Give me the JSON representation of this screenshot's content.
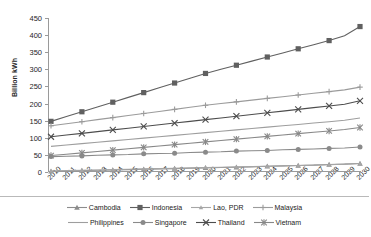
{
  "chart_data": {
    "type": "line",
    "title": "",
    "xlabel": "",
    "ylabel": "Billion kWh",
    "ylim": [
      0,
      450
    ],
    "ytick_step": 50,
    "yticks": [
      0,
      50,
      100,
      150,
      200,
      250,
      300,
      350,
      400,
      450
    ],
    "grid": false,
    "legend_position": "bottom",
    "x": [
      2010,
      2011,
      2012,
      2013,
      2014,
      2015,
      2016,
      2017,
      2018,
      2019,
      2020,
      2021,
      2022,
      2023,
      2024,
      2025,
      2026,
      2027,
      2028,
      2029,
      2030
    ],
    "categories": [
      "2010",
      "2011",
      "2012",
      "2013",
      "2014",
      "2015",
      "2016",
      "2017",
      "2018",
      "2019",
      "2020",
      "2021",
      "2022",
      "2023",
      "2024",
      "2025",
      "2026",
      "2027",
      "2028",
      "2029",
      "2030"
    ],
    "series": [
      {
        "name": "Cambodia",
        "marker": "triangle",
        "color": "#8c8c8c",
        "values": [
          2,
          3,
          4,
          5,
          6,
          7,
          8,
          9,
          10,
          11,
          12,
          13,
          14,
          15,
          17,
          18,
          19,
          20,
          22,
          23,
          25
        ]
      },
      {
        "name": "Indonesia",
        "marker": "square",
        "color": "#606060",
        "values": [
          148,
          162,
          176,
          190,
          204,
          218,
          232,
          246,
          260,
          274,
          288,
          300,
          312,
          324,
          336,
          348,
          360,
          372,
          384,
          398,
          425
        ]
      },
      {
        "name": "Lao, PDR",
        "marker": "triangle-small",
        "color": "#a6a6a6",
        "values": [
          3,
          4,
          5,
          6,
          7,
          8,
          9,
          10,
          11,
          12,
          13,
          14,
          15,
          16,
          17,
          18,
          19,
          20,
          21,
          23,
          25
        ]
      },
      {
        "name": "Malaysia",
        "marker": "plus",
        "color": "#9b9b9b",
        "values": [
          135,
          141,
          147,
          153,
          159,
          165,
          171,
          177,
          183,
          189,
          195,
          200,
          205,
          210,
          215,
          220,
          225,
          230,
          235,
          240,
          248
        ]
      },
      {
        "name": "Philippines",
        "marker": "none",
        "color": "#9e9e9e",
        "values": [
          75,
          79,
          83,
          87,
          91,
          95,
          99,
          103,
          107,
          111,
          115,
          119,
          123,
          127,
          131,
          135,
          139,
          143,
          147,
          151,
          158
        ]
      },
      {
        "name": "Singapore",
        "marker": "circle",
        "color": "#8a8a8a",
        "values": [
          45,
          46,
          47,
          49,
          50,
          51,
          53,
          54,
          55,
          57,
          58,
          59,
          61,
          62,
          63,
          65,
          66,
          67,
          69,
          70,
          73
        ]
      },
      {
        "name": "Thailand",
        "marker": "cross",
        "color": "#4d4d4d",
        "values": [
          103,
          108,
          113,
          118,
          123,
          128,
          133,
          138,
          143,
          148,
          153,
          158,
          163,
          168,
          173,
          178,
          183,
          188,
          193,
          198,
          208
        ]
      },
      {
        "name": "Vietnam",
        "marker": "asterisk",
        "color": "#888888",
        "values": [
          48,
          52,
          56,
          60,
          64,
          68,
          72,
          76,
          80,
          84,
          88,
          92,
          96,
          100,
          104,
          108,
          112,
          116,
          120,
          124,
          130
        ]
      }
    ]
  },
  "legend": {
    "row1": [
      "Cambodia",
      "Indonesia",
      "Lao, PDR",
      "Malaysia"
    ],
    "row2": [
      "Philippines",
      "Singapore",
      "Thailand",
      "Vietnam"
    ]
  }
}
